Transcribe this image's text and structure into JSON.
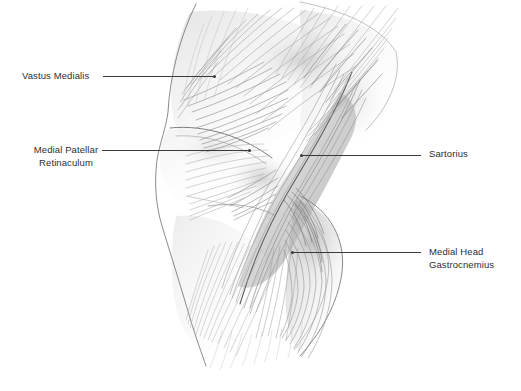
{
  "figure": {
    "background_color": "#ffffff",
    "line_color": "#3a3a3a",
    "text_color": "#2e2e2e",
    "width": 521,
    "height": 391
  },
  "labels": {
    "vastus_medialis": {
      "text": "Vastus Medialis",
      "side": "left"
    },
    "medial_patellar_retinaculum": {
      "line1": "Medial Patellar",
      "line2": "Retinaculum",
      "side": "left"
    },
    "sartorius": {
      "text": "Sartorius",
      "side": "right"
    },
    "medial_head_gastrocnemius": {
      "line1": "Medial Head",
      "line2": "Gastrocnemius",
      "side": "right"
    }
  },
  "leaders": [
    {
      "name": "leader-vastus-medialis",
      "x": 103,
      "y": 76,
      "length": 112,
      "dot_side": "right"
    },
    {
      "name": "leader-medial-patellar-retinaculum",
      "x": 102,
      "y": 150,
      "length": 148,
      "dot_side": "right"
    },
    {
      "name": "leader-sartorius",
      "x": 301,
      "y": 155,
      "length": 120,
      "dot_side": "left"
    },
    {
      "name": "leader-medial-head-gastrocnemius",
      "x": 292,
      "y": 252,
      "length": 129,
      "dot_side": "left"
    }
  ],
  "illustration": {
    "medium": "graphite pencil drawing",
    "subject": "knee, medial aspect",
    "structures": [
      "Vastus Medialis",
      "Medial Patellar Retinaculum",
      "Sartorius",
      "Medial Head Gastrocnemius"
    ]
  }
}
